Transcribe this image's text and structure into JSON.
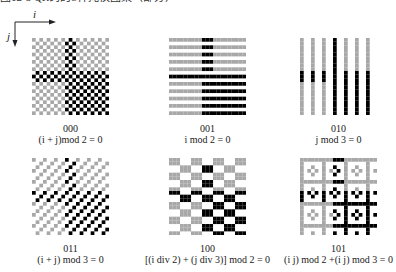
{
  "top_text": "图12-5  QR码的8种掩模图案（部分）",
  "axes": {
    "x_label": "i",
    "y_label": "j"
  },
  "colors": {
    "light_module": "#a8a8a8",
    "dark_module": "#000000",
    "background": "#ffffff"
  },
  "grid_size": 21,
  "patterns": [
    {
      "code": "000",
      "formula": "(i + j)mod 2 = 0",
      "mask": 0,
      "x": 32,
      "y": 38,
      "code_y": 123,
      "formula_y": 134
    },
    {
      "code": "001",
      "formula": "i mod 2 = 0",
      "mask": 1,
      "x": 169,
      "y": 38,
      "code_y": 123,
      "formula_y": 134
    },
    {
      "code": "010",
      "formula": "j mod 3 = 0",
      "mask": 2,
      "x": 300,
      "y": 38,
      "code_y": 123,
      "formula_y": 134
    },
    {
      "code": "011",
      "formula": "(i + j) mod 3 = 0",
      "mask": 3,
      "x": 32,
      "y": 158,
      "code_y": 243,
      "formula_y": 254
    },
    {
      "code": "100",
      "formula": "[(i div 2) + (j div 3)] mod 2 = 0",
      "mask": 4,
      "x": 169,
      "y": 158,
      "code_y": 243,
      "formula_y": 254
    },
    {
      "code": "101",
      "formula": "(i j) mod 2 +(i j) mod 3 = 0",
      "mask": 5,
      "x": 300,
      "y": 158,
      "code_y": 243,
      "formula_y": 254
    }
  ]
}
